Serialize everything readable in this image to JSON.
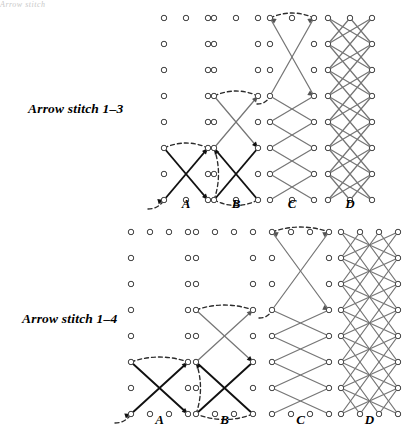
{
  "figure": {
    "type": "diagram",
    "page_fragment_text": "Arrow stitch",
    "background_color": "#ffffff",
    "dot_color": "#4a4a4a",
    "stitch_dark_color": "#111111",
    "stitch_gray_color": "#767676",
    "guide_color": "#2b2b2b"
  },
  "rows": [
    {
      "id": "row-1-3",
      "label": "Arrow stitch 1–3",
      "label_x": 28,
      "label_y": 101,
      "span": 2,
      "columns": 3,
      "col_gap": 22,
      "row_gap": 26,
      "grid_top": 18,
      "grid_rows": 8,
      "panels": [
        {
          "letter": "A",
          "origin_x": 164,
          "letter_y": 196,
          "style": "start"
        },
        {
          "letter": "B",
          "origin_x": 214,
          "letter_y": 196,
          "style": "second"
        },
        {
          "letter": "C",
          "origin_x": 270,
          "letter_y": 196,
          "style": "progress"
        },
        {
          "letter": "D",
          "origin_x": 328,
          "letter_y": 196,
          "style": "complete"
        }
      ]
    },
    {
      "id": "row-1-4",
      "label": "Arrow stitch 1–4",
      "label_x": 22,
      "label_y": 311,
      "span": 3,
      "columns": 4,
      "col_gap": 19,
      "row_gap": 26,
      "grid_top": 232,
      "grid_rows": 8,
      "panels": [
        {
          "letter": "A",
          "origin_x": 131,
          "letter_y": 412,
          "style": "start"
        },
        {
          "letter": "B",
          "origin_x": 196,
          "letter_y": 412,
          "style": "second"
        },
        {
          "letter": "C",
          "origin_x": 272,
          "letter_y": 412,
          "style": "progress"
        },
        {
          "letter": "D",
          "origin_x": 341,
          "letter_y": 412,
          "style": "complete"
        }
      ]
    }
  ],
  "panel_letters": [
    "A",
    "B",
    "C",
    "D"
  ],
  "legend": {
    "a_meaning": "first stitch begun",
    "b_meaning": "second stitch crossing",
    "c_meaning": "pattern in progress",
    "d_meaning": "completed band"
  }
}
